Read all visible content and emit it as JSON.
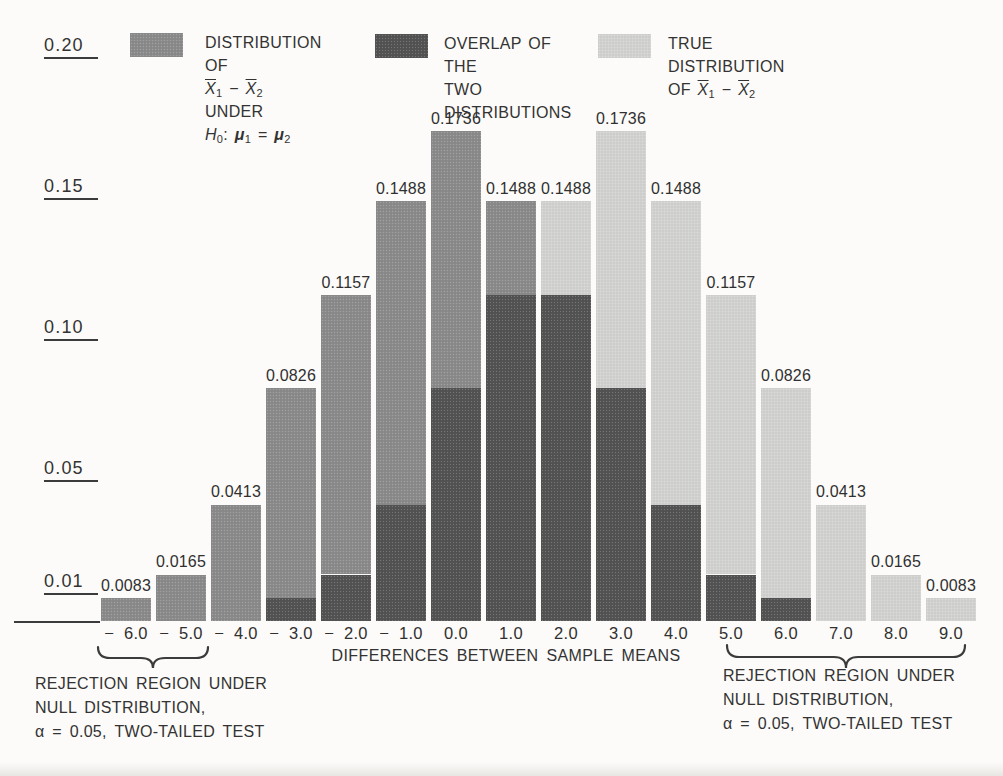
{
  "figure": {
    "background": "#fcfbf9",
    "text_color": "#333333",
    "axis_color": "#3b3b3b"
  },
  "legend": {
    "items": [
      {
        "role": "null",
        "lines": [
          [
            {
              "t": "DISTRIBUTION OF"
            }
          ],
          [
            {
              "xbar": "1"
            },
            {
              "t": " − "
            },
            {
              "xbar": "2"
            },
            {
              "t": " UNDER"
            }
          ],
          [
            {
              "it": "H",
              "sub": "0"
            },
            {
              "t": ": "
            },
            {
              "mu": "1"
            },
            {
              "t": " = "
            },
            {
              "mu": "2"
            }
          ]
        ]
      },
      {
        "role": "overlap",
        "lines": [
          [
            {
              "t": "OVERLAP OF THE"
            }
          ],
          [
            {
              "t": "TWO DISTRIBUTIONS"
            }
          ]
        ]
      },
      {
        "role": "true",
        "lines": [
          [
            {
              "t": "TRUE DISTRIBUTION"
            }
          ],
          [
            {
              "t": "OF "
            },
            {
              "xbar": "1"
            },
            {
              "t": " − "
            },
            {
              "xbar": "2"
            }
          ]
        ]
      }
    ]
  },
  "chart_data": {
    "type": "bar",
    "title": "",
    "xlabel": "DIFFERENCES BETWEEN SAMPLE MEANS",
    "ylabel": "",
    "categories": [
      "− 6.0",
      "− 5.0",
      "− 4.0",
      "− 3.0",
      "− 2.0",
      "− 1.0",
      "0.0",
      "1.0",
      "2.0",
      "3.0",
      "4.0",
      "5.0",
      "6.0",
      "7.0",
      "8.0",
      "9.0"
    ],
    "series": [
      {
        "name": "DISTRIBUTION OF X̄1 − X̄2 UNDER H0: μ1 = μ2",
        "role": "null",
        "color": "#8b8b8b",
        "values": [
          0.0083,
          0.0165,
          0.0413,
          0.0826,
          0.1157,
          0.1488,
          0.1736,
          0.1488,
          0.1157,
          0.0826,
          0.0413,
          0.0165,
          0.0083,
          0,
          0,
          0
        ]
      },
      {
        "name": "TRUE DISTRIBUTION OF X̄1 − X̄2",
        "role": "true",
        "color": "#d2d2d0",
        "values": [
          0,
          0,
          0,
          0.0083,
          0.0165,
          0.0413,
          0.0826,
          0.1157,
          0.1488,
          0.1736,
          0.1488,
          0.1157,
          0.0826,
          0.0413,
          0.0165,
          0.0083
        ]
      }
    ],
    "overlap": {
      "name": "OVERLAP OF THE TWO DISTRIBUTIONS",
      "role": "overlap",
      "color": "#535353",
      "values": [
        0,
        0,
        0,
        0.0083,
        0.0165,
        0.0413,
        0.0826,
        0.1157,
        0.1157,
        0.0826,
        0.0413,
        0.0165,
        0.0083,
        0,
        0,
        0
      ]
    },
    "bar_labels": [
      "0.0083",
      "0.0165",
      "0.0413",
      "0.0826",
      "0.1157",
      "0.1488",
      "0.1736",
      "0.1488",
      "0.1488",
      "0.1736",
      "0.1488",
      "0.1157",
      "0.0826",
      "0.0413",
      "0.0165",
      "0.0083"
    ],
    "y_ticks": [
      "0.20",
      "0.15",
      "0.10",
      "0.05",
      "0.01"
    ],
    "y_tick_values": [
      0.2,
      0.15,
      0.1,
      0.05,
      0.01
    ],
    "ylim": [
      0,
      0.2
    ],
    "grid": false,
    "legend_position": "top"
  },
  "annotations": {
    "left": {
      "lines": [
        "REJECTION REGION UNDER",
        "NULL DISTRIBUTION,",
        "α = 0.05, TWO-TAILED TEST"
      ]
    },
    "right": {
      "lines": [
        "REJECTION REGION UNDER",
        "NULL DISTRIBUTION,",
        "α = 0.05, TWO-TAILED TEST"
      ]
    }
  }
}
